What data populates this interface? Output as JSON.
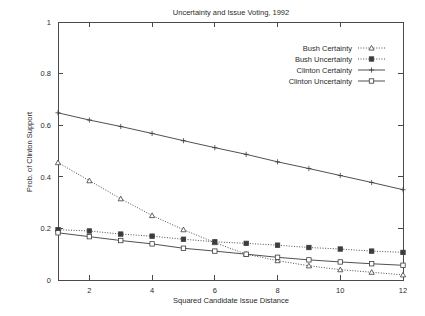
{
  "chart_data": {
    "type": "line",
    "title": "Uncertainty and Issue Voting, 1992",
    "xlabel": "Squared Candidate Issue Distance",
    "ylabel": "Prob. of Clinton Support",
    "x": [
      1,
      2,
      3,
      4,
      5,
      6,
      7,
      8,
      9,
      10,
      11,
      12
    ],
    "xlim": [
      1,
      12
    ],
    "ylim": [
      0,
      1
    ],
    "xticks": [
      2,
      4,
      6,
      8,
      10,
      12
    ],
    "xtick_labels": [
      "2",
      "4",
      "6",
      "8",
      "10",
      "12"
    ],
    "yticks": [
      0,
      0.2,
      0.4,
      0.6,
      0.8,
      1
    ],
    "ytick_labels": [
      "0",
      "0.2",
      "0.4",
      "0.6",
      "0.8",
      "1"
    ],
    "grid": false,
    "legend_position": "top-right",
    "series": [
      {
        "name": "Bush Certainty",
        "marker": "triangle-open",
        "linestyle": "dotted",
        "values": [
          0.455,
          0.385,
          0.315,
          0.25,
          0.195,
          0.145,
          0.1,
          0.075,
          0.055,
          0.04,
          0.03,
          0.02
        ]
      },
      {
        "name": "Bush Uncertainty",
        "marker": "square-filled",
        "linestyle": "dotted",
        "values": [
          0.195,
          0.19,
          0.178,
          0.17,
          0.158,
          0.148,
          0.142,
          0.135,
          0.126,
          0.12,
          0.112,
          0.107
        ]
      },
      {
        "name": "Clinton Certainty",
        "marker": "plus",
        "linestyle": "solid",
        "values": [
          0.648,
          0.62,
          0.595,
          0.568,
          0.54,
          0.513,
          0.487,
          0.458,
          0.432,
          0.405,
          0.378,
          0.35
        ]
      },
      {
        "name": "Clinton Uncertainty",
        "marker": "square-open",
        "linestyle": "solid",
        "values": [
          0.183,
          0.168,
          0.153,
          0.14,
          0.123,
          0.112,
          0.1,
          0.088,
          0.078,
          0.07,
          0.063,
          0.057
        ]
      }
    ]
  },
  "colors": {
    "line": "#3c3c3c",
    "axis": "#4a4a4a",
    "text": "#2b2b2b",
    "background": "#ffffff"
  }
}
